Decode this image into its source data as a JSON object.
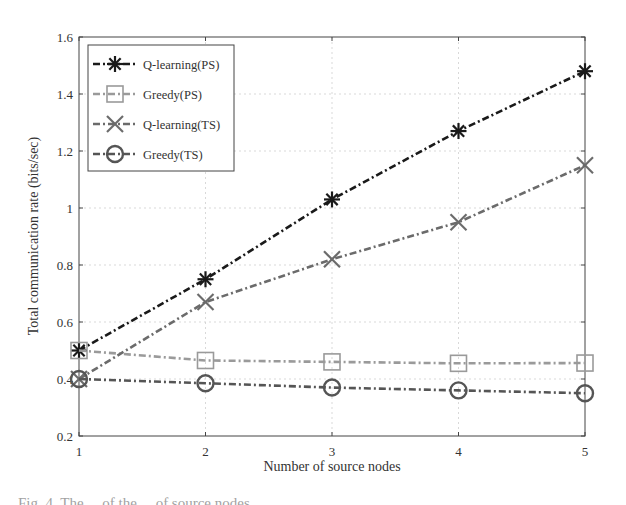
{
  "chart_data": {
    "type": "line",
    "title": "",
    "xlabel": "Number of source nodes",
    "ylabel": "Total communication rate (bits/sec)",
    "x": [
      1,
      2,
      3,
      4,
      5
    ],
    "xticks": [
      "1",
      "2",
      "3",
      "4",
      "5"
    ],
    "yticks": [
      "0.2",
      "0.4",
      "0.6",
      "0.8",
      "1",
      "1.2",
      "1.4",
      "1.6"
    ],
    "xlim": [
      1,
      5
    ],
    "ylim": [
      0.2,
      1.6
    ],
    "grid": true,
    "legend_position": "upper left",
    "series": [
      {
        "name": "Q-learning(PS)",
        "marker": "asterisk",
        "color": "#1a1a1a",
        "values": [
          0.5,
          0.75,
          1.03,
          1.27,
          1.48
        ]
      },
      {
        "name": "Greedy(PS)",
        "marker": "square",
        "color": "#9a9a9a",
        "values": [
          0.5,
          0.465,
          0.46,
          0.455,
          0.456
        ]
      },
      {
        "name": "Q-learning(TS)",
        "marker": "x",
        "color": "#6b6b6b",
        "values": [
          0.4,
          0.67,
          0.82,
          0.95,
          1.15
        ]
      },
      {
        "name": "Greedy(TS)",
        "marker": "circle",
        "color": "#555555",
        "values": [
          0.4,
          0.385,
          0.37,
          0.36,
          0.35
        ]
      }
    ]
  },
  "caption": {
    "fragment": "Fig. 4.  The  ...  of  the  ...  of  source  nodes  ..."
  }
}
